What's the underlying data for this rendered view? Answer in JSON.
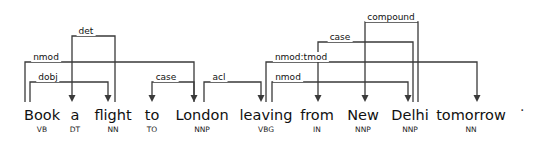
{
  "figure": {
    "type": "dependency-parse-tree",
    "sentence": "Book a flight to London leaving from New Delhi tomorrow",
    "line_color": "#3a3a3a",
    "text_color": "#111111",
    "background": "#ffffff",
    "punctuation": "."
  },
  "tokens": [
    {
      "id": 1,
      "form": "Book",
      "pos": "VB",
      "x": 42
    },
    {
      "id": 2,
      "form": "a",
      "pos": "DT",
      "x": 75
    },
    {
      "id": 3,
      "form": "flight",
      "pos": "NN",
      "x": 113
    },
    {
      "id": 4,
      "form": "to",
      "pos": "TO",
      "x": 152
    },
    {
      "id": 5,
      "form": "London",
      "pos": "NNP",
      "x": 202
    },
    {
      "id": 6,
      "form": "leaving",
      "pos": "VBG",
      "x": 266
    },
    {
      "id": 7,
      "form": "from",
      "pos": "IN",
      "x": 317
    },
    {
      "id": 8,
      "form": "New",
      "pos": "NNP",
      "x": 363
    },
    {
      "id": 9,
      "form": "Delhi",
      "pos": "NNP",
      "x": 410
    },
    {
      "id": 10,
      "form": "tomorrow",
      "pos": "NN",
      "x": 471
    }
  ],
  "arcs": [
    {
      "label": "dobj",
      "head": "Book",
      "dep": "flight",
      "x1": 30,
      "x2": 108,
      "y": 82,
      "label_x": 48,
      "label_y": 72
    },
    {
      "label": "nmod",
      "head": "Book",
      "dep": "London",
      "x1": 25,
      "x2": 194,
      "y": 62,
      "label_x": 46,
      "label_y": 52
    },
    {
      "label": "det",
      "head": "flight",
      "dep": "a",
      "x1": 115,
      "x2": 72,
      "y": 36,
      "label_x": 86,
      "label_y": 26
    },
    {
      "label": "case",
      "head": "London",
      "dep": "to",
      "x1": 194,
      "x2": 152,
      "y": 82,
      "label_x": 166,
      "label_y": 72
    },
    {
      "label": "acl",
      "head": "flight",
      "dep": "leaving",
      "x1": 204,
      "x2": 261,
      "y": 82,
      "label_x": 219,
      "label_y": 72
    },
    {
      "label": "nmod",
      "head": "leaving",
      "dep": "Delhi",
      "x1": 272,
      "x2": 408,
      "y": 82,
      "label_x": 288,
      "label_y": 72
    },
    {
      "label": "nmod:tmod",
      "head": "leaving",
      "dep": "tomorrow",
      "x1": 266,
      "x2": 477,
      "y": 62,
      "label_x": 301,
      "label_y": 52
    },
    {
      "label": "case",
      "head": "Delhi",
      "dep": "from",
      "x1": 413,
      "x2": 318,
      "y": 42,
      "label_x": 340,
      "label_y": 32
    },
    {
      "label": "compound",
      "head": "Delhi",
      "dep": "New",
      "x1": 418,
      "x2": 365,
      "y": 22,
      "label_x": 391,
      "label_y": 12
    }
  ],
  "geometry": {
    "word_top": 108,
    "baseline_y": 102,
    "arrow_half_width": 3.5,
    "arrow_height": 7
  }
}
